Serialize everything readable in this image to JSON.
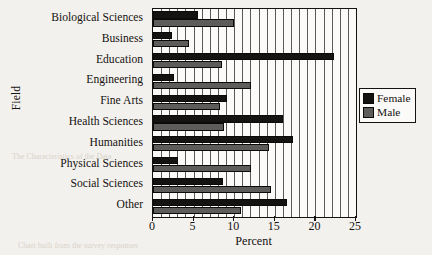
{
  "chart_data": {
    "type": "bar",
    "orientation": "horizontal",
    "title": "",
    "xlabel": "Percent",
    "ylabel": "Field",
    "xlim": [
      0,
      25
    ],
    "xticks": [
      0,
      5,
      10,
      15,
      20,
      25
    ],
    "xtick_labels": [
      "0",
      "5",
      "10",
      "15",
      "20",
      "25"
    ],
    "grid": true,
    "grid_interval": 1,
    "legend_position": "right",
    "categories": [
      "Biological Sciences",
      "Business",
      "Education",
      "Engineering",
      "Fine Arts",
      "Health Sciences",
      "Humanities",
      "Physical Sciences",
      "Social Sciences",
      "Other"
    ],
    "series": [
      {
        "name": "Female",
        "color": "#151312",
        "values": [
          5.6,
          2.3,
          22.3,
          2.6,
          9.1,
          16.0,
          17.2,
          3.1,
          8.6,
          16.5
        ]
      },
      {
        "name": "Male",
        "color": "#5e5c5a",
        "values": [
          10.0,
          4.4,
          8.5,
          12.1,
          8.2,
          8.7,
          14.3,
          12.1,
          14.5,
          10.8
        ]
      }
    ]
  },
  "legend": {
    "entries": [
      {
        "label": "Female"
      },
      {
        "label": "Male"
      }
    ]
  }
}
